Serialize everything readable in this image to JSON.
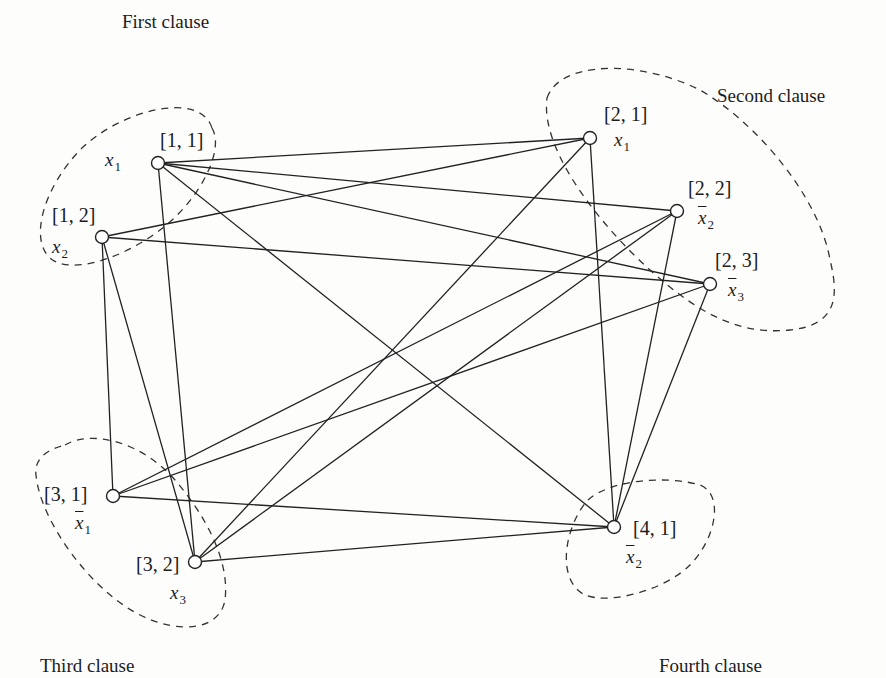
{
  "diagram": {
    "type": "graph",
    "clauses": [
      {
        "id": 1,
        "title": "First clause",
        "title_pos": [
          122,
          12
        ]
      },
      {
        "id": 2,
        "title": "Second clause",
        "title_pos": [
          717,
          86
        ]
      },
      {
        "id": 3,
        "title": "Third clause",
        "title_pos": [
          40,
          656
        ]
      },
      {
        "id": 4,
        "title": "Fourth clause",
        "title_pos": [
          659,
          656
        ]
      }
    ],
    "nodes": [
      {
        "key": "n11",
        "id_label": "[1, 1]",
        "literal_var": "x",
        "literal_sub": "1",
        "negated": false,
        "x": 158,
        "y": 163
      },
      {
        "key": "n12",
        "id_label": "[1, 2]",
        "literal_var": "x",
        "literal_sub": "2",
        "negated": false,
        "x": 102,
        "y": 237
      },
      {
        "key": "n21",
        "id_label": "[2, 1]",
        "literal_var": "x",
        "literal_sub": "1",
        "negated": false,
        "x": 590,
        "y": 138
      },
      {
        "key": "n22",
        "id_label": "[2, 2]",
        "literal_var": "x",
        "literal_sub": "2",
        "negated": true,
        "x": 677,
        "y": 211
      },
      {
        "key": "n23",
        "id_label": "[2, 3]",
        "literal_var": "x",
        "literal_sub": "3",
        "negated": true,
        "x": 710,
        "y": 284
      },
      {
        "key": "n31",
        "id_label": "[3, 1]",
        "literal_var": "x",
        "literal_sub": "1",
        "negated": true,
        "x": 113,
        "y": 496
      },
      {
        "key": "n32",
        "id_label": "[3, 2]",
        "literal_var": "x",
        "literal_sub": "3",
        "negated": false,
        "x": 195,
        "y": 562
      },
      {
        "key": "n41",
        "id_label": "[4, 1]",
        "literal_var": "x",
        "literal_sub": "2",
        "negated": true,
        "x": 614,
        "y": 527
      }
    ],
    "edges": [
      [
        "n11",
        "n21"
      ],
      [
        "n11",
        "n22"
      ],
      [
        "n11",
        "n23"
      ],
      [
        "n11",
        "n32"
      ],
      [
        "n11",
        "n41"
      ],
      [
        "n12",
        "n21"
      ],
      [
        "n12",
        "n23"
      ],
      [
        "n12",
        "n31"
      ],
      [
        "n12",
        "n32"
      ],
      [
        "n21",
        "n32"
      ],
      [
        "n21",
        "n41"
      ],
      [
        "n22",
        "n31"
      ],
      [
        "n22",
        "n32"
      ],
      [
        "n22",
        "n41"
      ],
      [
        "n23",
        "n31"
      ],
      [
        "n23",
        "n41"
      ],
      [
        "n31",
        "n41"
      ],
      [
        "n32",
        "n41"
      ]
    ]
  }
}
